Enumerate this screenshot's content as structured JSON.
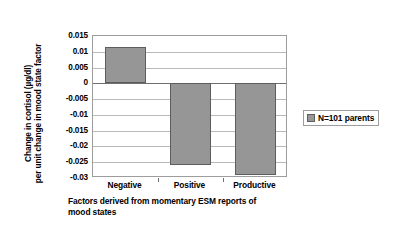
{
  "chart_data": {
    "type": "bar",
    "title": "",
    "categories": [
      "Negative",
      "Positive",
      "Productive"
    ],
    "values": [
      0.0115,
      -0.026,
      -0.029
    ],
    "series": [
      {
        "name": "N=101 parents",
        "values": [
          0.0115,
          -0.026,
          -0.029
        ],
        "color": "#969696"
      }
    ],
    "xlabel_lines": [
      "Factors derived from momentary ESM reports of",
      "mood states"
    ],
    "ylabel_lines": [
      "Change in cortisol (µg/dl)",
      "per unit change in mood state factor"
    ],
    "ylim": [
      -0.03,
      0.015
    ],
    "ytick_step": 0.005,
    "ytick_labels": [
      "0.015",
      "0.01",
      "0.005",
      "0",
      "-0.005",
      "-0.01",
      "-0.015",
      "-0.02",
      "-0.025",
      "-0.03"
    ],
    "ytick_values": [
      0.015,
      0.01,
      0.005,
      0,
      -0.005,
      -0.01,
      -0.015,
      -0.02,
      -0.025,
      -0.03
    ],
    "grid": true,
    "grid_axis": "y",
    "legend_position": "right",
    "legend_entries": [
      "N=101 parents"
    ],
    "bar_color": "#969696",
    "bar_border_color": "#5d5d5d",
    "gridline_color": "#b9b9b9",
    "axis_color": "#9d9d9d",
    "background": "#ffffff"
  },
  "legend": {
    "label": "N=101 parents"
  }
}
